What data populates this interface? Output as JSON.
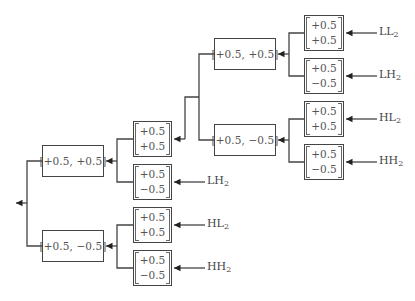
{
  "diagram": {
    "type": "filter-bank-tree",
    "root": {
      "output_arrow": "left",
      "children": [
        {
          "id": "l1a",
          "label": "[+0.5, +0.5]",
          "children": [
            {
              "id": "v_a",
              "vector": [
                "+0.5",
                "+0.5"
              ],
              "children": [
                {
                  "id": "l2a",
                  "label": "[+0.5, +0.5]",
                  "children": [
                    {
                      "id": "v_ll",
                      "vector": [
                        "+0.5",
                        "+0.5"
                      ],
                      "input": "LL",
                      "sub": "2"
                    },
                    {
                      "id": "v_lh",
                      "vector": [
                        "+0.5",
                        "−0.5"
                      ],
                      "input": "LH",
                      "sub": "2"
                    }
                  ]
                },
                {
                  "id": "l2b",
                  "label": "[+0.5, −0.5]",
                  "children": [
                    {
                      "id": "v_hl",
                      "vector": [
                        "+0.5",
                        "+0.5"
                      ],
                      "input": "HL",
                      "sub": "2"
                    },
                    {
                      "id": "v_hh",
                      "vector": [
                        "+0.5",
                        "−0.5"
                      ],
                      "input": "HH",
                      "sub": "2"
                    }
                  ]
                }
              ]
            },
            {
              "id": "v_b",
              "vector": [
                "+0.5",
                "−0.5"
              ],
              "input": "LH",
              "sub": "2"
            }
          ]
        },
        {
          "id": "l1b",
          "label": "[+0.5, −0.5]",
          "children": [
            {
              "id": "v_c",
              "vector": [
                "+0.5",
                "+0.5"
              ],
              "input": "HL",
              "sub": "2"
            },
            {
              "id": "v_d",
              "vector": [
                "+0.5",
                "−0.5"
              ],
              "input": "HH",
              "sub": "2"
            }
          ]
        }
      ]
    }
  },
  "boxes": {
    "l1a": "[+0.5, +0.5]",
    "l1b": "[+0.5, −0.5]",
    "l2a": "[+0.5, +0.5]",
    "l2b": "[+0.5, −0.5]",
    "v_a": [
      "+0.5",
      "+0.5"
    ],
    "v_b": [
      "+0.5",
      "−0.5"
    ],
    "v_c": [
      "+0.5",
      "+0.5"
    ],
    "v_d": [
      "+0.5",
      "−0.5"
    ],
    "v_ll": [
      "+0.5",
      "+0.5"
    ],
    "v_lh": [
      "+0.5",
      "−0.5"
    ],
    "v_hl": [
      "+0.5",
      "+0.5"
    ],
    "v_hh": [
      "+0.5",
      "−0.5"
    ]
  },
  "inputs": {
    "ll_top": {
      "main": "LL",
      "sub": "2"
    },
    "lh_top": {
      "main": "LH",
      "sub": "2"
    },
    "hl_top": {
      "main": "HL",
      "sub": "2"
    },
    "hh_top": {
      "main": "HH",
      "sub": "2"
    },
    "lh_mid": {
      "main": "LH",
      "sub": "2"
    },
    "hl_mid": {
      "main": "HL",
      "sub": "2"
    },
    "hh_mid": {
      "main": "HH",
      "sub": "2"
    }
  }
}
